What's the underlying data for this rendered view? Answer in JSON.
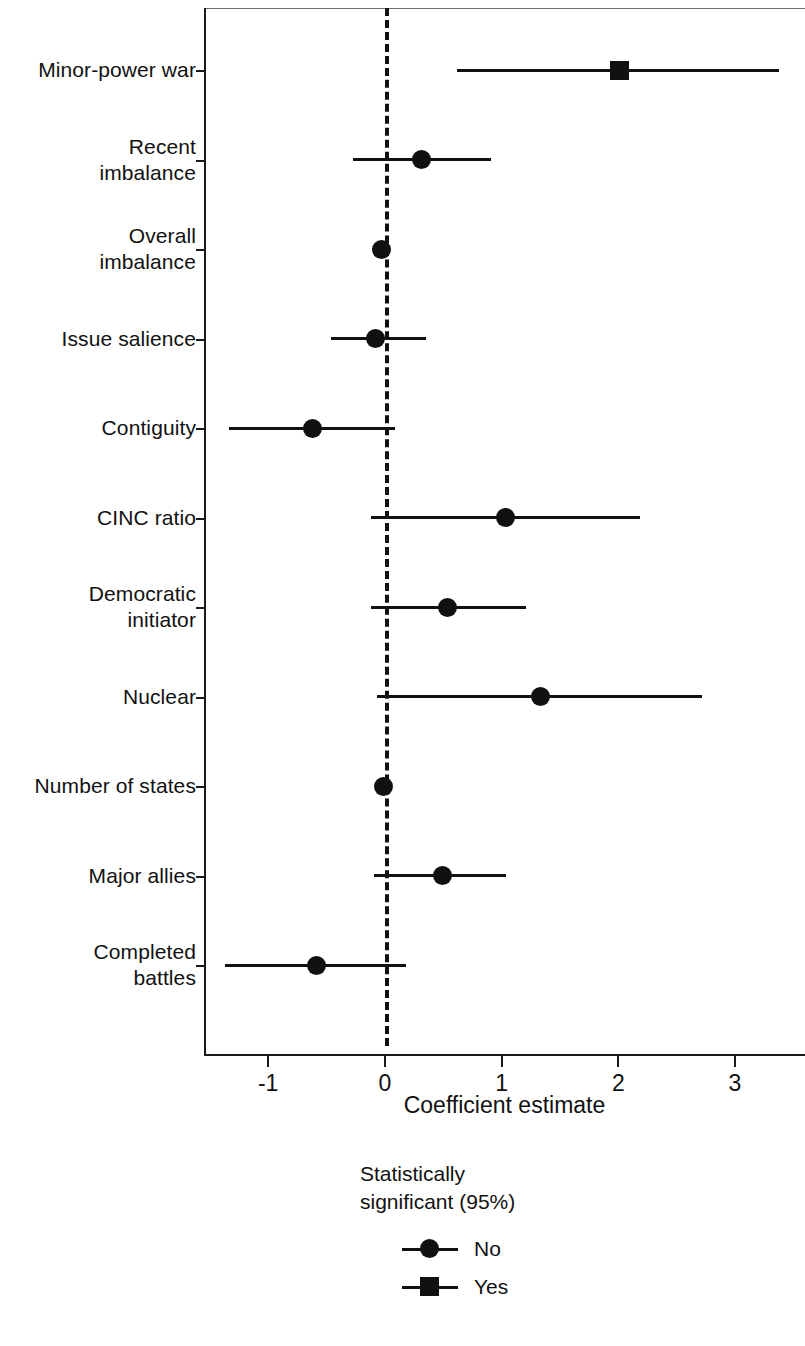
{
  "chart_data": {
    "type": "scatter",
    "subtype": "coefficient-plot",
    "title": "",
    "xlabel": "Coefficient estimate",
    "ylabel": "",
    "xlim": [
      -1.55,
      3.6
    ],
    "xticks": [
      -1,
      0,
      1,
      2,
      3
    ],
    "xticklabels": [
      "-1",
      "0",
      "1",
      "2",
      "3"
    ],
    "grid": false,
    "reference_line": {
      "value": 0,
      "style": "dashed"
    },
    "legend": {
      "position": "below-plot-center",
      "title": "Statistically\nsignificant (95%)",
      "entries": [
        {
          "label": "No",
          "marker": "circle"
        },
        {
          "label": "Yes",
          "marker": "square"
        }
      ]
    },
    "categories": [
      "Minor-power war",
      "Recent imbalance",
      "Overall imbalance",
      "Issue salience",
      "Contiguity",
      "CINC ratio",
      "Democratic initiator",
      "Nuclear",
      "Number of states",
      "Major allies",
      "Completed battles"
    ],
    "points": [
      {
        "label": "Minor-power war",
        "label_lines": [
          "Minor-power war"
        ],
        "estimate": 2.01,
        "ci_low": 0.62,
        "ci_high": 3.38,
        "significant": true,
        "marker": "square"
      },
      {
        "label": "Recent imbalance",
        "label_lines": [
          "Recent",
          "imbalance"
        ],
        "estimate": 0.31,
        "ci_low": -0.27,
        "ci_high": 0.91,
        "significant": false,
        "marker": "circle"
      },
      {
        "label": "Overall imbalance",
        "label_lines": [
          "Overall",
          "imbalance"
        ],
        "estimate": -0.03,
        "ci_low": -0.06,
        "ci_high": 0.02,
        "significant": false,
        "marker": "circle"
      },
      {
        "label": "Issue salience",
        "label_lines": [
          "Issue salience"
        ],
        "estimate": -0.08,
        "ci_low": -0.46,
        "ci_high": 0.35,
        "significant": false,
        "marker": "circle"
      },
      {
        "label": "Contiguity",
        "label_lines": [
          "Contiguity"
        ],
        "estimate": -0.62,
        "ci_low": -1.34,
        "ci_high": 0.09,
        "significant": false,
        "marker": "circle"
      },
      {
        "label": "CINC ratio",
        "label_lines": [
          "CINC ratio"
        ],
        "estimate": 1.03,
        "ci_low": -0.12,
        "ci_high": 2.19,
        "significant": false,
        "marker": "circle"
      },
      {
        "label": "Democratic initiator",
        "label_lines": [
          "Democratic",
          "initiator"
        ],
        "estimate": 0.54,
        "ci_low": -0.12,
        "ci_high": 1.21,
        "significant": false,
        "marker": "circle"
      },
      {
        "label": "Nuclear",
        "label_lines": [
          "Nuclear"
        ],
        "estimate": 1.33,
        "ci_low": -0.07,
        "ci_high": 2.72,
        "significant": false,
        "marker": "circle"
      },
      {
        "label": "Number of states",
        "label_lines": [
          "Number of states"
        ],
        "estimate": -0.01,
        "ci_low": -0.05,
        "ci_high": 0.04,
        "significant": false,
        "marker": "circle"
      },
      {
        "label": "Major allies",
        "label_lines": [
          "Major allies"
        ],
        "estimate": 0.49,
        "ci_low": -0.09,
        "ci_high": 1.04,
        "significant": false,
        "marker": "circle"
      },
      {
        "label": "Completed battles",
        "label_lines": [
          "Completed",
          "battles"
        ],
        "estimate": -0.59,
        "ci_low": -1.37,
        "ci_high": 0.18,
        "significant": false,
        "marker": "circle"
      }
    ]
  },
  "axis": {
    "x_title": "Coefficient estimate"
  },
  "legend": {
    "title": "Statistically\nsignificant (95%)",
    "no_label": "No",
    "yes_label": "Yes"
  },
  "colors": {
    "ink": "#111111",
    "axis": "#1a1a1a",
    "background": "#ffffff"
  }
}
